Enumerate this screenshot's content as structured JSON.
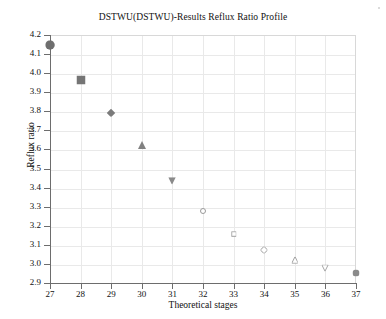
{
  "chart_data": {
    "type": "scatter",
    "title": "DSTWU(DSTWU)-Results Reflux Ratio Profile",
    "xlabel": "Theoretical stages",
    "ylabel": "Reflux ratio",
    "xlim": [
      27,
      37
    ],
    "ylim": [
      2.9,
      4.2
    ],
    "grid": true,
    "legend": "none",
    "xticks": [
      "27",
      "28",
      "29",
      "30",
      "31",
      "32",
      "33",
      "34",
      "35",
      "36",
      "37"
    ],
    "yticks": [
      "2.9",
      "3.0",
      "3.1",
      "3.2",
      "3.3",
      "3.4",
      "3.5",
      "3.6",
      "3.7",
      "3.8",
      "3.9",
      "4.0",
      "4.1",
      "4.2"
    ],
    "x": [
      27,
      28,
      29,
      30,
      31,
      32,
      33,
      34,
      35,
      36,
      37
    ],
    "values": [
      4.145,
      3.963,
      3.793,
      3.625,
      3.437,
      3.276,
      3.156,
      3.073,
      3.021,
      2.977,
      2.951
    ],
    "series": [
      {
        "name": "Reflux ratio",
        "points": [
          {
            "x": 27,
            "y": 4.145,
            "marker": "circle",
            "filled": true,
            "size": 9.5,
            "color": "#6e6e6e"
          },
          {
            "x": 28,
            "y": 3.963,
            "marker": "square",
            "filled": true,
            "size": 9.0,
            "color": "#757575"
          },
          {
            "x": 29,
            "y": 3.793,
            "marker": "diamond",
            "filled": true,
            "size": 8.5,
            "color": "#7b7b7b"
          },
          {
            "x": 30,
            "y": 3.625,
            "marker": "triangle-up",
            "filled": true,
            "size": 8.0,
            "color": "#818181"
          },
          {
            "x": 31,
            "y": 3.437,
            "marker": "triangle-down",
            "filled": true,
            "size": 7.5,
            "color": "#8a8a8a"
          },
          {
            "x": 32,
            "y": 3.276,
            "marker": "circle",
            "filled": false,
            "size": 6.0,
            "color": "#9a9a9a"
          },
          {
            "x": 33,
            "y": 3.156,
            "marker": "square",
            "filled": false,
            "size": 5.6,
            "color": "#9e9e9e"
          },
          {
            "x": 34,
            "y": 3.073,
            "marker": "diamond",
            "filled": false,
            "size": 7.2,
            "color": "#9a9a9a"
          },
          {
            "x": 35,
            "y": 3.021,
            "marker": "triangle-up",
            "filled": false,
            "size": 6.6,
            "color": "#a2a2a2"
          },
          {
            "x": 36,
            "y": 2.977,
            "marker": "triangle-down",
            "filled": false,
            "size": 6.4,
            "color": "#a6a6a6"
          },
          {
            "x": 37,
            "y": 2.951,
            "marker": "circle",
            "filled": true,
            "size": 7.0,
            "color": "#8a8a8a"
          }
        ]
      }
    ]
  },
  "colors": {
    "gridline": "#e9e9e9",
    "axis": "#6d6d6d",
    "marker": "#808080",
    "text": "#111111",
    "background": "#ffffff"
  }
}
